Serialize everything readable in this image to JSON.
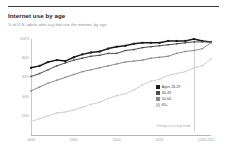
{
  "header": {
    "title": "Internet use by age",
    "subtitle": "% of U.S. adults who say that use the internet, by age"
  },
  "legend": {
    "items": [
      {
        "label": "Ages 18-29",
        "color": "#1a1a1a"
      },
      {
        "label": "30-49",
        "color": "#4d4d4d"
      },
      {
        "label": "50-64",
        "color": "#8c8c8c"
      },
      {
        "label": "65+",
        "color": "#d0d0d0"
      }
    ]
  },
  "annotation": {
    "text": "Change in survey mode"
  },
  "chart_data": {
    "type": "line",
    "title": "Internet use by age",
    "subtitle": "% of U.S. adults who say that use the internet, by age",
    "xlabel": "",
    "ylabel": "",
    "ylim": [
      0,
      100
    ],
    "xlim": [
      2000,
      2021
    ],
    "grid": false,
    "legend_position": "inside-right",
    "yticks": [
      "100%",
      "80%",
      "60%",
      "40%",
      "20%"
    ],
    "ytick_values": [
      100,
      80,
      60,
      40,
      20
    ],
    "xticks": [
      "2000",
      "2005",
      "2010",
      "2015",
      "2020",
      "2021"
    ],
    "xtick_values": [
      2000,
      2005,
      2010,
      2015,
      2020,
      2021
    ],
    "reference_line_x": 2019,
    "x": [
      2000,
      2001,
      2002,
      2003,
      2004,
      2005,
      2006,
      2007,
      2008,
      2009,
      2010,
      2011,
      2012,
      2013,
      2014,
      2015,
      2016,
      2017,
      2018,
      2019,
      2020,
      2021
    ],
    "series": [
      {
        "name": "Ages 18-29",
        "color": "#1a1a1a",
        "values": [
          70,
          72,
          76,
          78,
          77,
          81,
          84,
          86,
          87,
          90,
          92,
          93,
          95,
          96,
          96,
          96,
          98,
          98,
          98,
          100,
          98,
          97
        ]
      },
      {
        "name": "30-49",
        "color": "#4d4d4d",
        "values": [
          61,
          64,
          68,
          72,
          75,
          78,
          80,
          82,
          83,
          85,
          85,
          88,
          89,
          91,
          92,
          93,
          94,
          95,
          96,
          97,
          97,
          97
        ]
      },
      {
        "name": "50-64",
        "color": "#8c8c8c",
        "values": [
          46,
          50,
          54,
          57,
          60,
          63,
          66,
          68,
          70,
          72,
          74,
          76,
          77,
          78,
          80,
          81,
          82,
          85,
          87,
          88,
          90,
          96
        ]
      },
      {
        "name": "65+",
        "color": "#d0d0d0",
        "values": [
          14,
          17,
          20,
          23,
          24,
          26,
          29,
          32,
          34,
          38,
          41,
          43,
          47,
          52,
          56,
          58,
          62,
          64,
          66,
          70,
          72,
          79
        ]
      }
    ]
  }
}
